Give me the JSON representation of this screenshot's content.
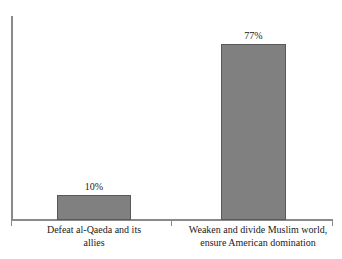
{
  "chart_data": {
    "type": "bar",
    "title": "",
    "subtitle": "",
    "xlabel": "",
    "ylabel": "",
    "categories": [
      "Defeat al-Qaeda and its allies",
      "Weaken and divide Muslim world, ensure American domination"
    ],
    "values": [
      10,
      77
    ],
    "value_labels": [
      "10%",
      "77%"
    ],
    "units": "percent",
    "ylim": [
      0,
      90
    ],
    "grid": false,
    "legend": false,
    "legend_position": "none",
    "series": [
      {
        "name": "Share of respondents",
        "values": [
          10,
          77
        ]
      }
    ],
    "bar_color": "#808080",
    "bar_border_color": "#595959",
    "axis_color": "#8a8a8a",
    "background_color": "#ffffff"
  },
  "axes": {
    "y_axis_name": "value-axis",
    "x_axis_name": "category-axis",
    "tick_labels": []
  },
  "bars": [
    {
      "value_label": "10%",
      "label_line_1": "Defeat al-Qaeda and its",
      "label_line_2": "allies"
    },
    {
      "value_label": "77%",
      "label_line_1": "Weaken and divide Muslim world,",
      "label_line_2": "ensure American domination"
    }
  ]
}
